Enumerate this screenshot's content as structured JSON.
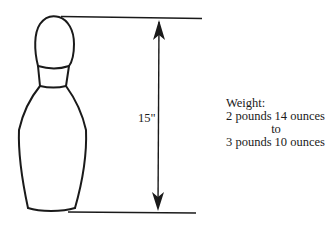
{
  "diagram": {
    "height_label": "15\"",
    "weight": {
      "heading": "Weight:",
      "min": "2 pounds 14 ounces",
      "connector": "to",
      "max": "3 pounds 10 ounces"
    },
    "colors": {
      "ink": "#1a1a1a",
      "background": "#ffffff"
    }
  }
}
